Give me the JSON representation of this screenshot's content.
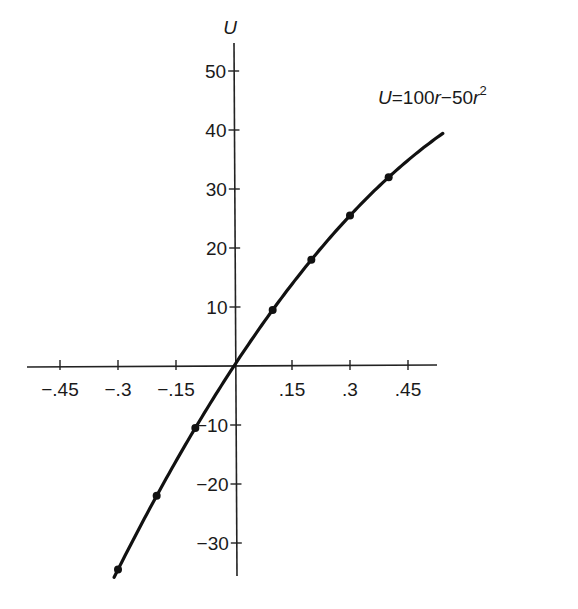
{
  "chart_data": {
    "type": "line",
    "title": "",
    "xlabel": "r",
    "ylabel": "U",
    "equation_label": {
      "lhs": "U",
      "rhs_a": "=100",
      "var1": "r",
      "rhs_b": "−50",
      "var2": "r",
      "exp": "2"
    },
    "function": "U = 100r - 50r^2",
    "xlim": [
      -0.5,
      0.55
    ],
    "ylim": [
      -37,
      55
    ],
    "x_ticks": [
      -0.45,
      -0.3,
      -0.15,
      0.15,
      0.3,
      0.45
    ],
    "x_tick_labels": [
      "−.45",
      "−.3",
      "−.15",
      ".15",
      ".3",
      ".45"
    ],
    "y_ticks": [
      50,
      40,
      30,
      20,
      10,
      -10,
      -20,
      -30
    ],
    "y_tick_labels": [
      "50",
      "40",
      "30",
      "20",
      "10",
      "−10",
      "−20",
      "−30"
    ],
    "curve_range": [
      -0.31,
      0.54
    ],
    "series": [
      {
        "name": "U = 100r - 50r^2",
        "marked_points": [
          {
            "r": -0.3,
            "U": -34.5
          },
          {
            "r": -0.2,
            "U": -22
          },
          {
            "r": -0.1,
            "U": -10.5
          },
          {
            "r": 0.0,
            "U": 0
          },
          {
            "r": 0.1,
            "U": 9.5
          },
          {
            "r": 0.2,
            "U": 18
          },
          {
            "r": 0.3,
            "U": 25.5
          },
          {
            "r": 0.4,
            "U": 32
          }
        ]
      }
    ],
    "grid": false,
    "legend": "none",
    "line_color": "#111111"
  }
}
